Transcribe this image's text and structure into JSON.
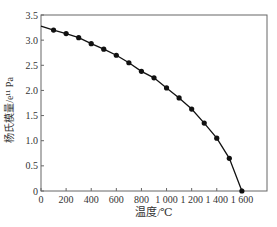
{
  "chart_data": {
    "type": "line",
    "title": "",
    "xlabel": "温度/℃",
    "ylabel": "杨氏模量/e¹¹ Pa",
    "xlim": [
      0,
      1800
    ],
    "ylim": [
      0,
      3.5
    ],
    "xticks": [
      0,
      200,
      400,
      600,
      800,
      1000,
      1200,
      1400,
      1600
    ],
    "xtick_labels": [
      "0",
      "200",
      "400",
      "600",
      "800",
      "1 000",
      "1 200",
      "1 400",
      "1 600"
    ],
    "yticks": [
      0,
      0.5,
      1.0,
      1.5,
      2.0,
      2.5,
      3.0,
      3.5
    ],
    "ytick_labels": [
      "0",
      "0.5",
      "1.0",
      "1.5",
      "2.0",
      "2.5",
      "3.0",
      "3.5"
    ],
    "grid": false,
    "legend": null,
    "series": [
      {
        "name": "Young's modulus",
        "x": [
          0,
          100,
          200,
          300,
          400,
          500,
          600,
          700,
          800,
          900,
          1000,
          1100,
          1200,
          1300,
          1400,
          1500,
          1600
        ],
        "values": [
          3.28,
          3.2,
          3.13,
          3.05,
          2.93,
          2.82,
          2.7,
          2.55,
          2.38,
          2.25,
          2.05,
          1.85,
          1.63,
          1.35,
          1.05,
          0.65,
          0.0
        ],
        "markers_from_index": 1
      }
    ],
    "colors": {
      "line": "#111111",
      "axis": "#666666",
      "text": "#333333"
    }
  }
}
